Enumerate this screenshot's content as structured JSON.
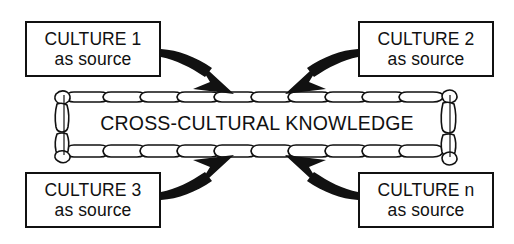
{
  "diagram": {
    "title": "CROSS-CULTURAL KNOWLEDGE",
    "background_color": "#ffffff",
    "stroke_color": "#111111",
    "center_banner": {
      "label": "CROSS-CULTURAL KNOWLEDGE",
      "style_name": "scroll-banner"
    },
    "boxes": [
      {
        "id": "culture-1",
        "line_1": "CULTURE 1",
        "line_2": "as source",
        "position": "top-left"
      },
      {
        "id": "culture-2",
        "line_1": "CULTURE 2",
        "line_2": "as source",
        "position": "top-right"
      },
      {
        "id": "culture-3",
        "line_1": "CULTURE 3",
        "line_2": "as source",
        "position": "bottom-left"
      },
      {
        "id": "culture-n",
        "line_1": "CULTURE n",
        "line_2": "as source",
        "position": "bottom-right"
      }
    ],
    "arrows": [
      {
        "id": "arrow-culture-1",
        "from": "CULTURE 1",
        "to": "CROSS-CULTURAL KNOWLEDGE",
        "direction": "down-right"
      },
      {
        "id": "arrow-culture-2",
        "from": "CULTURE 2",
        "to": "CROSS-CULTURAL KNOWLEDGE",
        "direction": "down-left"
      },
      {
        "id": "arrow-culture-3",
        "from": "CULTURE 3",
        "to": "CROSS-CULTURAL KNOWLEDGE",
        "direction": "up-right"
      },
      {
        "id": "arrow-culture-n",
        "from": "CULTURE n",
        "to": "CROSS-CULTURAL KNOWLEDGE",
        "direction": "up-left"
      }
    ]
  }
}
